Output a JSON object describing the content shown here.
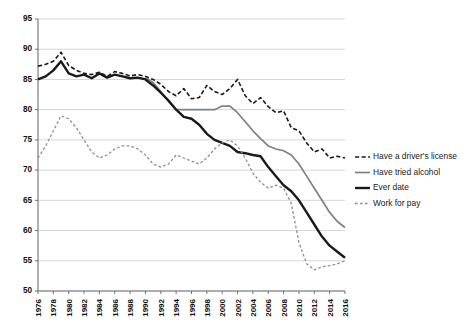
{
  "chart_data": {
    "type": "line",
    "title": "",
    "subtitle": "",
    "xlabel": "",
    "ylabel": "",
    "xlim": [
      1976,
      2016
    ],
    "ylim": [
      50,
      95
    ],
    "grid": true,
    "legend_position": "right",
    "ytick_labels": [
      "50",
      "55",
      "60",
      "65",
      "70",
      "75",
      "80",
      "85",
      "90",
      "95"
    ],
    "ytick_values": [
      50,
      55,
      60,
      65,
      70,
      75,
      80,
      85,
      90,
      95
    ],
    "xtick_labels": [
      "1976",
      "1978",
      "1980",
      "1982",
      "1984",
      "1986",
      "1988",
      "1990",
      "1992",
      "1994",
      "1996",
      "1998",
      "2000",
      "2002",
      "2004",
      "2006",
      "2008",
      "2010",
      "2012",
      "2014",
      "2016"
    ],
    "xtick_values": [
      1976,
      1978,
      1980,
      1982,
      1984,
      1986,
      1988,
      1990,
      1992,
      1994,
      1996,
      1998,
      2000,
      2002,
      2004,
      2006,
      2008,
      2010,
      2012,
      2014,
      2016
    ],
    "x": [
      1976,
      1977,
      1978,
      1979,
      1980,
      1981,
      1982,
      1983,
      1984,
      1985,
      1986,
      1987,
      1988,
      1989,
      1990,
      1991,
      1992,
      1993,
      1994,
      1995,
      1996,
      1997,
      1998,
      1999,
      2000,
      2001,
      2002,
      2003,
      2004,
      2005,
      2006,
      2007,
      2008,
      2009,
      2010,
      2011,
      2012,
      2013,
      2014,
      2015,
      2016
    ],
    "series": [
      {
        "name": "Have a driver's license",
        "style": "dashed",
        "color": "#1a1a1a",
        "width": 1.6,
        "values": [
          87.2,
          87.5,
          88.0,
          89.5,
          87.3,
          86.5,
          86.0,
          85.8,
          86.2,
          85.5,
          86.3,
          86.0,
          85.6,
          85.8,
          85.5,
          85.0,
          84.2,
          83.0,
          82.3,
          83.5,
          81.8,
          82.0,
          84.0,
          83.0,
          82.5,
          83.5,
          85.0,
          82.3,
          81.0,
          82.0,
          80.5,
          79.5,
          79.8,
          77.0,
          76.5,
          74.5,
          73.0,
          73.5,
          72.0,
          72.3,
          72.0
        ]
      },
      {
        "name": "Have tried alcohol",
        "style": "solid",
        "color": "#7d8287",
        "width": 1.7,
        "values": [
          null,
          null,
          null,
          null,
          null,
          null,
          null,
          null,
          null,
          null,
          null,
          null,
          null,
          null,
          85.3,
          84.5,
          83.0,
          81.5,
          80.0,
          80.0,
          80.0,
          80.0,
          80.0,
          80.0,
          80.6,
          80.6,
          79.5,
          78.0,
          76.5,
          75.2,
          74.0,
          73.5,
          73.2,
          72.5,
          71.0,
          69.0,
          67.0,
          65.0,
          63.0,
          61.5,
          60.5
        ]
      },
      {
        "name": "Ever date",
        "style": "solid",
        "color": "#1a1a1a",
        "width": 2.4,
        "values": [
          85.0,
          85.5,
          86.5,
          88.0,
          86.0,
          85.5,
          85.8,
          85.2,
          86.0,
          85.3,
          85.8,
          85.5,
          85.2,
          85.3,
          85.0,
          84.0,
          82.8,
          81.5,
          80.0,
          78.8,
          78.5,
          77.5,
          76.0,
          75.0,
          74.5,
          74.0,
          73.0,
          72.8,
          72.5,
          72.3,
          70.5,
          69.0,
          67.5,
          66.5,
          65.0,
          63.0,
          61.0,
          59.0,
          57.5,
          56.5,
          55.5
        ]
      },
      {
        "name": "Work for pay",
        "style": "dotted",
        "color": "#8a8f94",
        "width": 1.3,
        "values": [
          72.0,
          74.0,
          76.5,
          79.0,
          78.5,
          77.0,
          75.0,
          73.0,
          72.0,
          72.5,
          73.5,
          74.0,
          74.0,
          73.5,
          72.5,
          71.0,
          70.5,
          71.0,
          72.5,
          72.0,
          71.5,
          71.0,
          72.0,
          73.5,
          74.5,
          75.0,
          74.0,
          72.0,
          69.5,
          68.0,
          67.0,
          67.5,
          67.0,
          64.5,
          58.0,
          54.5,
          53.5,
          54.0,
          54.2,
          54.5,
          55.0
        ]
      }
    ]
  },
  "legend": {
    "items": [
      {
        "label": "Have a driver's license"
      },
      {
        "label": "Have tried alcohol"
      },
      {
        "label": "Ever date"
      },
      {
        "label": "Work for pay"
      }
    ]
  }
}
